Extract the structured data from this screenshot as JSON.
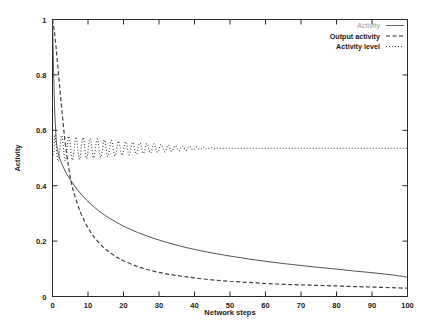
{
  "chart_data": {
    "type": "line",
    "title": "",
    "xlabel": "Network steps",
    "ylabel": "Activity",
    "xlim": [
      0,
      100
    ],
    "ylim": [
      0,
      1
    ],
    "xticks": [
      0,
      10,
      20,
      30,
      40,
      50,
      60,
      70,
      80,
      90,
      100
    ],
    "yticks": [
      0,
      0.2,
      0.4,
      0.6,
      0.8,
      1
    ],
    "xtick_labels": [
      "0",
      "10",
      "20",
      "30",
      "40",
      "50",
      "60",
      "70",
      "80",
      "90",
      "100"
    ],
    "ytick_labels": [
      "0",
      "0.2",
      "0.4",
      "0.6",
      "0.8",
      "1"
    ],
    "grid": false,
    "legend_position": "top-right",
    "series": [
      {
        "name": "Activity",
        "style": "solid",
        "color": "#555555",
        "x": [
          0,
          0.5,
          1,
          1.5,
          2,
          2.5,
          3,
          4,
          5,
          6,
          7,
          8,
          9,
          10,
          12,
          14,
          16,
          18,
          20,
          24,
          28,
          32,
          36,
          40,
          45,
          50,
          55,
          60,
          65,
          70,
          75,
          80,
          85,
          90,
          95,
          100
        ],
        "y": [
          1.0,
          0.72,
          0.575,
          0.525,
          0.5,
          0.483,
          0.468,
          0.443,
          0.422,
          0.403,
          0.386,
          0.37,
          0.356,
          0.343,
          0.32,
          0.3,
          0.283,
          0.268,
          0.254,
          0.231,
          0.212,
          0.196,
          0.182,
          0.17,
          0.157,
          0.146,
          0.136,
          0.127,
          0.119,
          0.112,
          0.105,
          0.099,
          0.092,
          0.086,
          0.079,
          0.07
        ]
      },
      {
        "name": "Output activity",
        "style": "dashed",
        "color": "#2b2b2b",
        "x": [
          0,
          0.5,
          1,
          1.5,
          2,
          2.5,
          3,
          3.5,
          4,
          4.5,
          5,
          5.5,
          6,
          7,
          8,
          9,
          10,
          11,
          12,
          14,
          16,
          18,
          20,
          24,
          28,
          32,
          36,
          40,
          45,
          50,
          55,
          60,
          65,
          70,
          75,
          80,
          85,
          90,
          95,
          100
        ],
        "y": [
          1.0,
          0.96,
          0.9,
          0.83,
          0.76,
          0.69,
          0.625,
          0.565,
          0.515,
          0.47,
          0.43,
          0.4,
          0.375,
          0.335,
          0.3,
          0.272,
          0.248,
          0.228,
          0.21,
          0.182,
          0.16,
          0.143,
          0.129,
          0.108,
          0.093,
          0.082,
          0.074,
          0.067,
          0.06,
          0.055,
          0.051,
          0.047,
          0.044,
          0.042,
          0.04,
          0.038,
          0.036,
          0.034,
          0.032,
          0.03
        ]
      },
      {
        "name": "Activity level",
        "style": "dotted",
        "color": "#3d3d3d",
        "description": "damped oscillation about 0.535, amplitude decays from ~0.05 to 0 by step 50",
        "baseline": 0.535,
        "initial_amplitude": 0.05,
        "damping_end_step": 50,
        "period": 2,
        "start_y": 0.5,
        "final_y": 0.535
      }
    ]
  },
  "legend": {
    "entries": [
      {
        "label": "Activity",
        "style": "solid"
      },
      {
        "label": "Output activity",
        "style": "dashed"
      },
      {
        "label": "Activity level",
        "style": "dotted"
      }
    ]
  },
  "axes": {
    "x_label": "Network steps",
    "y_label": "Activity"
  }
}
